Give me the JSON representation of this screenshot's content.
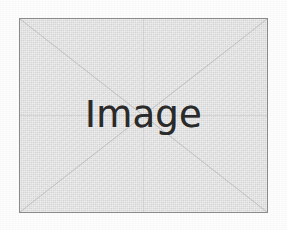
{
  "page": {
    "background_color": "#fdfdfd",
    "width": 287,
    "height": 230
  },
  "placeholder": {
    "caption": "Image",
    "fill_color": "#e2e2e2",
    "border_color": "#8c8c8c",
    "text_color": "#2b2b2b",
    "guide_color": "#a9a9a9",
    "crosshair_color": "#bdbdbd",
    "bounds": {
      "x": 19,
      "y": 18,
      "width": 249,
      "height": 195
    },
    "markings": [
      "diagonal-top-left-to-bottom-right",
      "diagonal-top-right-to-bottom-left",
      "center-horizontal-line",
      "center-vertical-line"
    ]
  }
}
